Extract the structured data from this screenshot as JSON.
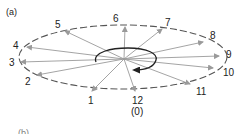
{
  "figure": {
    "panel_a_label": "(a)",
    "panel_b_label": "(b)",
    "colors": {
      "ellipse": "#555555",
      "rays": "#9a9a9a",
      "loop": "#222222",
      "text": "#222222"
    },
    "center": {
      "x": 124,
      "y": 59
    },
    "ellipse": {
      "cx": 123,
      "cy": 57,
      "rx": 104,
      "ry": 32,
      "style": "dashed"
    },
    "positions": [
      {
        "label": "1",
        "tip": [
          92,
          91
        ],
        "text": [
          88,
          104
        ]
      },
      {
        "label": "2",
        "tip": [
          37,
          75
        ],
        "text": [
          25,
          85
        ]
      },
      {
        "label": "3",
        "tip": [
          21,
          62
        ],
        "text": [
          9,
          66
        ]
      },
      {
        "label": "4",
        "tip": [
          27,
          47
        ],
        "text": [
          13,
          49
        ]
      },
      {
        "label": "5",
        "tip": [
          65,
          31
        ],
        "text": [
          55,
          28
        ]
      },
      {
        "label": "6",
        "tip": [
          125,
          27
        ],
        "text": [
          113,
          22
        ]
      },
      {
        "label": "7",
        "tip": [
          162,
          29
        ],
        "text": [
          165,
          26
        ]
      },
      {
        "label": "8",
        "tip": [
          203,
          42
        ],
        "text": [
          210,
          39
        ]
      },
      {
        "label": "9",
        "tip": [
          219,
          56
        ],
        "text": [
          226,
          58
        ]
      },
      {
        "label": "10",
        "tip": [
          213,
          68
        ],
        "text": [
          223,
          76
        ]
      },
      {
        "label": "11",
        "tip": [
          190,
          84
        ],
        "text": [
          196,
          95
        ]
      },
      {
        "label": "12",
        "sublabel": "(0)",
        "tip": [
          135,
          91
        ],
        "text": [
          132,
          104
        ]
      }
    ]
  }
}
